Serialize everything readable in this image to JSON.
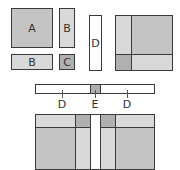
{
  "colors": {
    "A": "#c4c4c4",
    "B": "#d9d9d9",
    "C": "#b0b0b0",
    "D": "#ffffff",
    "E": "#b0b0b0",
    "border": "#3a3a3a"
  },
  "pieces": {
    "a": {
      "label": "A"
    },
    "b_vertical": {
      "label": "B"
    },
    "b_horizontal": {
      "label": "B"
    },
    "c": {
      "label": "C"
    },
    "d": {
      "label": "D"
    }
  },
  "strip": {
    "labels": [
      "D",
      "E",
      "D"
    ]
  }
}
